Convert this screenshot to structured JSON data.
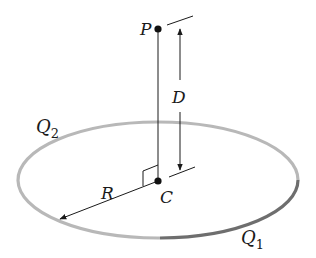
{
  "diagram": {
    "type": "charged ring geometry",
    "labels": {
      "point_p": "P",
      "center_c": "C",
      "distance_d": "D",
      "radius_r": "R",
      "charge_q1_base": "Q",
      "charge_q1_sub": "1",
      "charge_q2_base": "Q",
      "charge_q2_sub": "2"
    },
    "colors": {
      "ring_q2": "#b8b8b8",
      "ring_q1": "#6e6e6e",
      "line": "#1a1a1a",
      "background": "#ffffff"
    }
  }
}
